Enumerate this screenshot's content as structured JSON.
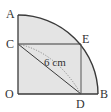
{
  "figure": {
    "colors": {
      "fill": "#e4e4e4",
      "stroke": "#3a3a3a",
      "text": "#333333"
    },
    "points": {
      "O": {
        "label": "O",
        "x": 18,
        "y": 94
      },
      "A": {
        "label": "A",
        "x": 18,
        "y": 15
      },
      "B": {
        "label": "B",
        "x": 98,
        "y": 94
      },
      "C": {
        "label": "C",
        "x": 18,
        "y": 44
      },
      "D": {
        "label": "D",
        "x": 81,
        "y": 94
      },
      "E": {
        "label": "E",
        "x": 81,
        "y": 44
      }
    },
    "labels": {
      "A": "A",
      "B": "B",
      "C": "C",
      "D": "D",
      "E": "E",
      "O": "O"
    },
    "measurement": {
      "segment": "CD",
      "text": "6 cm"
    }
  }
}
